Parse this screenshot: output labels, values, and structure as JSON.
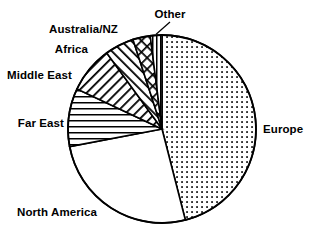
{
  "chart_data": {
    "type": "pie",
    "title": "",
    "subtitle": "",
    "xlabel": "",
    "ylabel": "",
    "legend_position": "none",
    "grid": false,
    "labels_placement": "outside-callout",
    "start_angle_deg": 0,
    "direction": "clockwise",
    "categories": [
      "Europe",
      "North America",
      "Far East",
      "Middle East",
      "Africa",
      "Australia/NZ",
      "Other"
    ],
    "values": [
      46,
      26,
      10,
      8,
      5,
      3,
      2
    ],
    "units": "percent",
    "slices": [
      {
        "label": "Europe",
        "value": 46,
        "pattern": "dots",
        "start_deg": 0,
        "end_deg": 165.6
      },
      {
        "label": "North America",
        "value": 26,
        "pattern": "blank",
        "start_deg": 165.6,
        "end_deg": 259.2
      },
      {
        "label": "Far East",
        "value": 10,
        "pattern": "horizontal-lines",
        "start_deg": 259.2,
        "end_deg": 295.2
      },
      {
        "label": "Middle East",
        "value": 8,
        "pattern": "diagonal-lines-forward",
        "start_deg": 295.2,
        "end_deg": 324.0
      },
      {
        "label": "Africa",
        "value": 5,
        "pattern": "diagonal-lines-back",
        "start_deg": 324.0,
        "end_deg": 342.0
      },
      {
        "label": "Australia/NZ",
        "value": 3,
        "pattern": "cross-hatch",
        "start_deg": 342.0,
        "end_deg": 352.8
      },
      {
        "label": "Other",
        "value": 2,
        "pattern": "vertical-lines",
        "start_deg": 352.8,
        "end_deg": 360.0
      }
    ],
    "geometry": {
      "center_x": 162,
      "center_y": 129,
      "radius": 94
    },
    "colors": {
      "stroke": "#000000",
      "fill": "#ffffff",
      "background": "#ffffff"
    }
  },
  "labels": {
    "europe": "Europe",
    "north_america": "North America",
    "far_east": "Far East",
    "middle_east": "Middle East",
    "africa": "Africa",
    "australia_nz": "Australia/NZ",
    "other": "Other"
  }
}
